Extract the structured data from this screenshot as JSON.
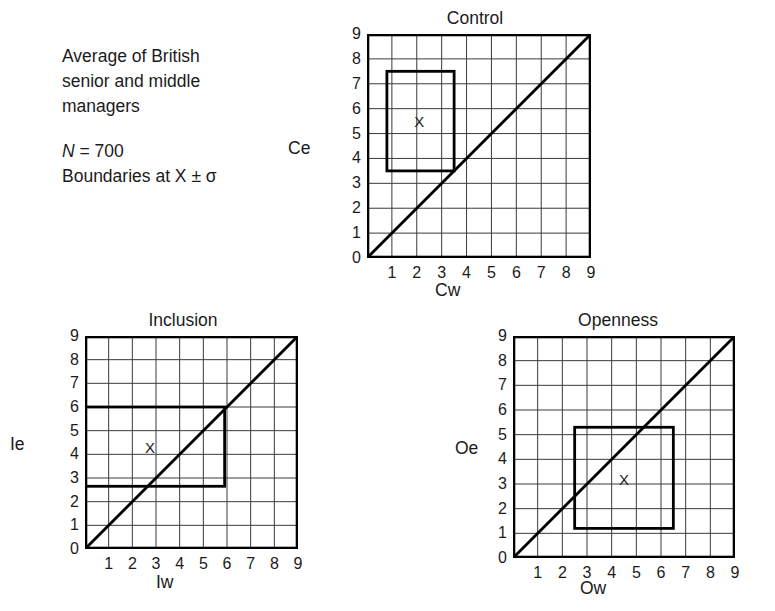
{
  "caption": {
    "line1": "Average of British",
    "line2": "senior and middle",
    "line3": "managers",
    "n_symbol": "N",
    "n_equals": "= 700",
    "boundaries": "Boundaries at X ± σ"
  },
  "ticks": [
    "0",
    "1",
    "2",
    "3",
    "4",
    "5",
    "6",
    "7",
    "8",
    "9"
  ],
  "chart_data": [
    {
      "type": "scatter",
      "id": "control",
      "title": "Control",
      "xlabel": "Cw",
      "ylabel": "Ce",
      "xlim": [
        0,
        9
      ],
      "ylim": [
        0,
        9
      ],
      "grid": true,
      "xticks": [
        "0",
        "1",
        "2",
        "3",
        "4",
        "5",
        "6",
        "7",
        "8",
        "9"
      ],
      "yticks": [
        "0",
        "1",
        "2",
        "3",
        "4",
        "5",
        "6",
        "7",
        "8",
        "9"
      ],
      "diagonal": {
        "from": [
          0,
          0
        ],
        "to": [
          9,
          9
        ]
      },
      "mean_marker": {
        "label": "X",
        "x": 2.1,
        "y": 5.5
      },
      "boundary_box": {
        "x0": 0.8,
        "x1": 3.5,
        "y0": 3.5,
        "y1": 7.5
      }
    },
    {
      "type": "scatter",
      "id": "inclusion",
      "title": "Inclusion",
      "xlabel": "Iw",
      "ylabel": "Ie",
      "xlim": [
        0,
        9
      ],
      "ylim": [
        0,
        9
      ],
      "grid": true,
      "xticks": [
        "0",
        "1",
        "2",
        "3",
        "4",
        "5",
        "6",
        "7",
        "8",
        "9"
      ],
      "yticks": [
        "0",
        "1",
        "2",
        "3",
        "4",
        "5",
        "6",
        "7",
        "8",
        "9"
      ],
      "diagonal": {
        "from": [
          0,
          0
        ],
        "to": [
          9,
          9
        ]
      },
      "mean_marker": {
        "label": "X",
        "x": 2.75,
        "y": 4.3
      },
      "boundary_box": {
        "x0": 0.0,
        "x1": 5.9,
        "y0": 2.65,
        "y1": 6.0
      }
    },
    {
      "type": "scatter",
      "id": "openness",
      "title": "Openness",
      "xlabel": "Ow",
      "ylabel": "Oe",
      "xlim": [
        0,
        9
      ],
      "ylim": [
        0,
        9
      ],
      "grid": true,
      "xticks": [
        "0",
        "1",
        "2",
        "3",
        "4",
        "5",
        "6",
        "7",
        "8",
        "9"
      ],
      "yticks": [
        "0",
        "1",
        "2",
        "3",
        "4",
        "5",
        "6",
        "7",
        "8",
        "9"
      ],
      "diagonal": {
        "from": [
          0,
          0
        ],
        "to": [
          9,
          9
        ]
      },
      "mean_marker": {
        "label": "X",
        "x": 4.5,
        "y": 3.2
      },
      "boundary_box": {
        "x0": 2.5,
        "x1": 6.5,
        "y0": 1.2,
        "y1": 5.3
      }
    }
  ],
  "colors": {
    "ink": "#1b1b1b",
    "grid": "#3a3a3a",
    "frame": "#000000",
    "background": "#ffffff"
  }
}
